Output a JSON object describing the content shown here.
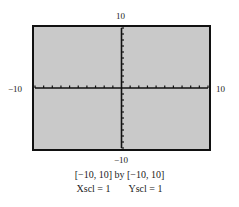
{
  "chart_data": {
    "type": "line",
    "title": "",
    "xlabel": "",
    "ylabel": "",
    "xlim": [
      -10,
      10
    ],
    "ylim": [
      -10,
      10
    ],
    "xscl": 1,
    "yscl": 1,
    "grid": false,
    "series": [],
    "tick_labels": {
      "top": "10",
      "bottom": "−10",
      "left": "−10",
      "right": "10"
    },
    "background_color": "#c9c9c9",
    "frame_color": "#111111",
    "axis_color": "#111111"
  },
  "caption": {
    "window": "[−10, 10] by [−10, 10]",
    "xscl": "Xscl = 1",
    "yscl": "Yscl = 1"
  }
}
